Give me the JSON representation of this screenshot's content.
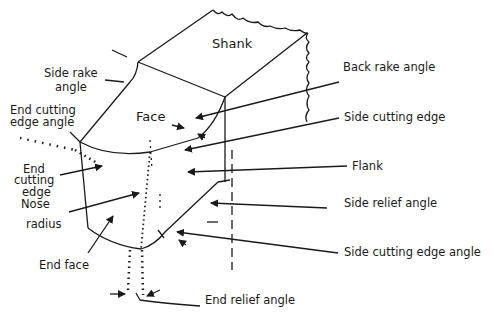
{
  "diagram": {
    "labels": {
      "shank": "Shank",
      "face": "Face",
      "side_rake_angle_1": "Side rake",
      "side_rake_angle_2": "angle",
      "end_cutting_edge_angle_1": "End cutting",
      "end_cutting_edge_angle_2": "edge angle",
      "end_cutting_edge_1": "End",
      "end_cutting_edge_2": "cutting",
      "end_cutting_edge_3": "edge",
      "nose_radius_1": "Nose",
      "nose_radius_2": "radius",
      "end_face": "End face",
      "back_rake_angle": "Back rake angle",
      "side_cutting_edge": "Side cutting edge",
      "flank": "Flank",
      "side_relief_angle": "Side relief angle",
      "side_cutting_edge_angle": "Side cutting edge angle",
      "end_relief_angle": "End relief angle"
    },
    "colors": {
      "line": "#1a1a1a",
      "background": "#ffffff"
    }
  }
}
